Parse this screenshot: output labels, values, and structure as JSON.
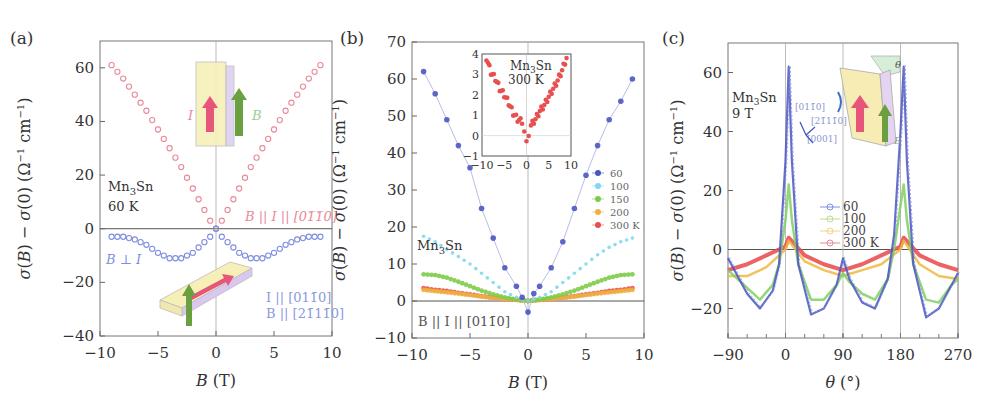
{
  "figure": {
    "panels": [
      "(a)",
      "(b)",
      "(c)"
    ]
  },
  "chart_data": [
    {
      "panel": "(a)",
      "type": "scatter",
      "xlabel": "B (T)",
      "ylabel": "σ(B) − σ(0) (Ω⁻¹ cm⁻¹)",
      "xlim": [
        -10,
        10
      ],
      "ylim": [
        -40,
        70
      ],
      "xticks": [
        -10,
        -5,
        0,
        5,
        10
      ],
      "yticks": [
        -40,
        -20,
        0,
        20,
        40,
        60
      ],
      "annotations": [
        "Mn3Sn",
        "60 K",
        "B || I || [01-10]",
        "B ⊥ I",
        "I || [01-10]",
        "B || [2-1-10]",
        "I",
        "B"
      ],
      "series": [
        {
          "name": "B || I || [01-10]",
          "color": "#e88a9a",
          "marker": "open-circle",
          "x": [
            -9,
            -8,
            -7,
            -6,
            -5,
            -4,
            -3,
            -2,
            -1,
            -0.5,
            0,
            0.5,
            1,
            2,
            3,
            4,
            5,
            6,
            7,
            8,
            9
          ],
          "y": [
            61,
            56,
            50,
            44,
            37,
            30,
            23,
            15,
            7,
            3,
            0,
            3,
            7,
            15,
            23,
            30,
            37,
            44,
            50,
            56,
            61
          ]
        },
        {
          "name": "B ⊥ I",
          "color": "#7f8fe0",
          "marker": "open-circle",
          "x": [
            -9,
            -8,
            -7,
            -6,
            -5,
            -4,
            -3,
            -2,
            -1,
            -0.5,
            0,
            0.5,
            1,
            2,
            3,
            4,
            5,
            6,
            7,
            8,
            9
          ],
          "y": [
            -3,
            -3,
            -4,
            -6,
            -9,
            -11,
            -11,
            -9,
            -5,
            -3,
            0,
            -3,
            -5,
            -9,
            -11,
            -11,
            -9,
            -6,
            -4,
            -3,
            -3
          ]
        }
      ]
    },
    {
      "panel": "(b)",
      "type": "scatter",
      "xlabel": "B (T)",
      "ylabel": "σ(B) − σ(0) (Ω⁻¹ cm⁻¹)",
      "xlim": [
        -10,
        10
      ],
      "ylim": [
        -10,
        70
      ],
      "xticks": [
        -10,
        -5,
        0,
        5,
        10
      ],
      "yticks": [
        -10,
        0,
        10,
        20,
        30,
        40,
        50,
        60,
        70
      ],
      "annotations": [
        "Mn3Sn",
        "B || I || [01-10]"
      ],
      "legend": [
        "60",
        "100",
        "150",
        "200",
        "300 K"
      ],
      "series": [
        {
          "name": "60",
          "color": "#4a56c0",
          "x": [
            -9,
            -8,
            -7,
            -6,
            -5,
            -4,
            -3,
            -2,
            -1,
            -0.5,
            0,
            0.5,
            1,
            2,
            3,
            4,
            5,
            6,
            7,
            8,
            9
          ],
          "y": [
            62,
            56,
            49,
            42,
            36,
            25,
            17,
            9,
            4,
            1,
            -3,
            2,
            4,
            9,
            16,
            25,
            34,
            42,
            49,
            54,
            60
          ]
        },
        {
          "name": "100",
          "color": "#7fd8f0",
          "x": [
            -9,
            -8,
            -7,
            -6,
            -5,
            -4,
            -3,
            -2,
            -1,
            0,
            1,
            2,
            3,
            4,
            5,
            6,
            7,
            8,
            9
          ],
          "y": [
            17.5,
            16,
            14,
            12,
            10,
            7.5,
            5,
            2.5,
            1,
            0,
            1,
            2.5,
            5,
            7.5,
            10,
            12.5,
            14.5,
            16,
            17
          ]
        },
        {
          "name": "150",
          "color": "#7ccc4a",
          "x": [
            -9,
            -8,
            -7,
            -6,
            -5,
            -4,
            -3,
            -2,
            -1,
            0,
            1,
            2,
            3,
            4,
            5,
            6,
            7,
            8,
            9
          ],
          "y": [
            7.2,
            7,
            6.3,
            5.2,
            4,
            2.8,
            1.8,
            1,
            0.4,
            0,
            0.4,
            1,
            1.8,
            2.8,
            4,
            5.2,
            6.3,
            7,
            7.2
          ]
        },
        {
          "name": "200",
          "color": "#f0b040",
          "x": [
            -9,
            -6,
            -3,
            0,
            3,
            6,
            9
          ],
          "y": [
            3,
            2,
            0.8,
            0,
            0.8,
            2,
            3
          ]
        },
        {
          "name": "300 K",
          "color": "#e85050",
          "x": [
            -9,
            -8,
            -7,
            -6,
            -5,
            -4,
            -3,
            -2,
            -1,
            0,
            1,
            2,
            3,
            4,
            5,
            6,
            7,
            8,
            9
          ],
          "y": [
            3.5,
            3,
            2.7,
            2.2,
            1.8,
            1.3,
            0.9,
            0.6,
            0.3,
            0,
            0.3,
            0.6,
            0.9,
            1.3,
            1.8,
            2.2,
            2.7,
            3,
            3.5
          ]
        }
      ],
      "inset": {
        "type": "scatter",
        "annotations": [
          "Mn3Sn",
          "300 K"
        ],
        "xlim": [
          -10,
          10
        ],
        "ylim": [
          -1,
          4
        ],
        "xticks": [
          -10,
          -5,
          0,
          5,
          10
        ],
        "yticks": [
          -1,
          0,
          1,
          2,
          3,
          4
        ],
        "color": "#e85050",
        "x": [
          -9,
          -8,
          -7,
          -6,
          -5,
          -4,
          -3,
          -2,
          -1,
          -0.5,
          0,
          0.5,
          1,
          2,
          3,
          4,
          5,
          6,
          7,
          8,
          9
        ],
        "y": [
          3.8,
          3.1,
          2.8,
          2.3,
          2.0,
          1.6,
          1.1,
          0.8,
          0.7,
          0.2,
          -0.4,
          0.1,
          0.5,
          0.8,
          1.2,
          1.5,
          1.9,
          2.3,
          2.7,
          3.2,
          3.8
        ]
      }
    },
    {
      "panel": "(c)",
      "type": "line",
      "xlabel": "θ (°)",
      "ylabel": "σ(B) − σ(0) (Ω⁻¹ cm⁻¹)",
      "xlim": [
        -90,
        270
      ],
      "ylim": [
        -30,
        70
      ],
      "xticks": [
        -90,
        0,
        90,
        180,
        270
      ],
      "yticks": [
        -20,
        0,
        20,
        40,
        60
      ],
      "annotations": [
        "Mn3Sn",
        "9 T",
        "[01-10]",
        "[2-1-10]",
        "[0001]",
        "θ",
        "B"
      ],
      "legend": [
        "60",
        "100",
        "200",
        "300 K"
      ],
      "series": [
        {
          "name": "60",
          "color": "#4a56c0",
          "x": [
            -90,
            -60,
            -40,
            -20,
            -10,
            0,
            5,
            10,
            20,
            40,
            60,
            80,
            90,
            100,
            120,
            140,
            160,
            170,
            180,
            185,
            190,
            200,
            220,
            240,
            260,
            270
          ],
          "y": [
            -3,
            -15,
            -20,
            -14,
            -5,
            30,
            62,
            30,
            -5,
            -22,
            -20,
            -12,
            -3,
            -10,
            -18,
            -20,
            -10,
            5,
            40,
            62,
            30,
            -5,
            -23,
            -20,
            -12,
            -8
          ]
        },
        {
          "name": "100",
          "color": "#80d060",
          "x": [
            -90,
            -60,
            -40,
            -20,
            -10,
            0,
            5,
            10,
            20,
            40,
            60,
            80,
            90,
            100,
            120,
            140,
            160,
            170,
            180,
            185,
            190,
            200,
            220,
            240,
            260,
            270
          ],
          "y": [
            -7,
            -13,
            -17,
            -12,
            -5,
            10,
            22,
            10,
            -5,
            -17,
            -17,
            -12,
            -8,
            -11,
            -15,
            -17,
            -10,
            0,
            15,
            22,
            10,
            -5,
            -17,
            -18,
            -12,
            -10
          ]
        },
        {
          "name": "200",
          "color": "#f0b840",
          "x": [
            -90,
            -60,
            -30,
            0,
            5,
            30,
            60,
            90,
            120,
            150,
            180,
            185,
            210,
            240,
            270
          ],
          "y": [
            -9,
            -9,
            -6,
            0,
            3,
            -4,
            -7,
            -9,
            -7,
            -5,
            0,
            3,
            -5,
            -9,
            -10
          ]
        },
        {
          "name": "300 K",
          "color": "#e84848",
          "x": [
            -90,
            -60,
            -30,
            0,
            5,
            30,
            60,
            90,
            120,
            150,
            180,
            185,
            210,
            240,
            270
          ],
          "y": [
            -7,
            -5,
            -2,
            1,
            4,
            -2,
            -5,
            -7,
            -5,
            -2,
            1,
            4,
            -2,
            -5,
            -7
          ]
        }
      ]
    }
  ]
}
